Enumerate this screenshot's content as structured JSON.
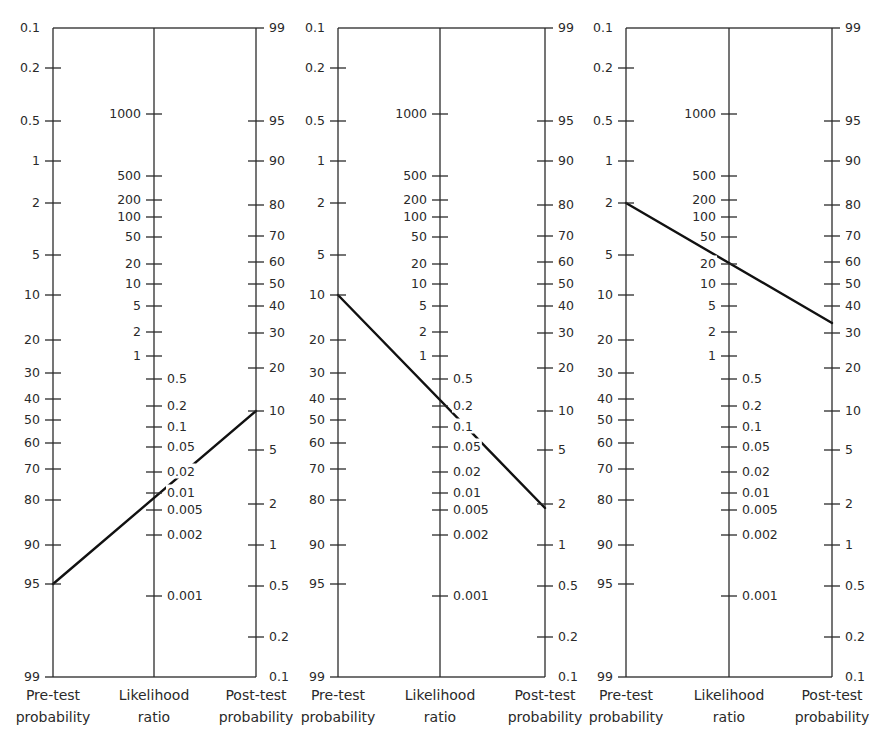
{
  "chart_data": {
    "type": "nomogram",
    "axes": {
      "pre_test": {
        "title_line1": "Pre-test",
        "title_line2": "probability",
        "ticks": [
          {
            "label": "0.1",
            "y": 28
          },
          {
            "label": "0.2",
            "y": 68
          },
          {
            "label": "0.5",
            "y": 121
          },
          {
            "label": "1",
            "y": 161
          },
          {
            "label": "2",
            "y": 203
          },
          {
            "label": "5",
            "y": 255
          },
          {
            "label": "10",
            "y": 295
          },
          {
            "label": "20",
            "y": 340
          },
          {
            "label": "30",
            "y": 373
          },
          {
            "label": "40",
            "y": 399
          },
          {
            "label": "50",
            "y": 420
          },
          {
            "label": "60",
            "y": 443
          },
          {
            "label": "70",
            "y": 469
          },
          {
            "label": "80",
            "y": 500
          },
          {
            "label": "90",
            "y": 545
          },
          {
            "label": "95",
            "y": 584
          },
          {
            "label": "99",
            "y": 677
          }
        ]
      },
      "likelihood_ratio": {
        "title_line1": "Likelihood",
        "title_line2": "ratio",
        "ticks_left": [
          {
            "label": "1000",
            "y": 114
          },
          {
            "label": "500",
            "y": 176
          },
          {
            "label": "200",
            "y": 200
          },
          {
            "label": "100",
            "y": 217
          },
          {
            "label": "50",
            "y": 237
          },
          {
            "label": "20",
            "y": 264
          },
          {
            "label": "10",
            "y": 284
          },
          {
            "label": "5",
            "y": 306
          },
          {
            "label": "2",
            "y": 332
          },
          {
            "label": "1",
            "y": 356
          }
        ],
        "ticks_right": [
          {
            "label": "0.5",
            "y": 379
          },
          {
            "label": "0.2",
            "y": 406
          },
          {
            "label": "0.1",
            "y": 427
          },
          {
            "label": "0.05",
            "y": 447
          },
          {
            "label": "0.02",
            "y": 472
          },
          {
            "label": "0.01",
            "y": 493
          },
          {
            "label": "0.005",
            "y": 510
          },
          {
            "label": "0.002",
            "y": 535
          },
          {
            "label": "0.001",
            "y": 596
          }
        ]
      },
      "post_test": {
        "title_line1": "Post-test",
        "title_line2": "probability",
        "ticks": [
          {
            "label": "99",
            "y": 28
          },
          {
            "label": "95",
            "y": 121
          },
          {
            "label": "90",
            "y": 161
          },
          {
            "label": "80",
            "y": 205
          },
          {
            "label": "70",
            "y": 236
          },
          {
            "label": "60",
            "y": 262
          },
          {
            "label": "50",
            "y": 284
          },
          {
            "label": "40",
            "y": 306
          },
          {
            "label": "30",
            "y": 333
          },
          {
            "label": "20",
            "y": 368
          },
          {
            "label": "10",
            "y": 411
          },
          {
            "label": "5",
            "y": 450
          },
          {
            "label": "2",
            "y": 504
          },
          {
            "label": "1",
            "y": 545
          },
          {
            "label": "0.5",
            "y": 586
          },
          {
            "label": "0.2",
            "y": 637
          },
          {
            "label": "0.1",
            "y": 677
          }
        ]
      }
    },
    "panels": [
      {
        "name": "panel-1",
        "x_pre": 53,
        "x_lr": 154,
        "x_post": 256,
        "pre_test_probability_pct": 95,
        "likelihood_ratio": 0.01,
        "post_test_probability_pct": 10,
        "line": {
          "x1": 53,
          "y1": 584,
          "x2": 256,
          "y2": 411
        }
      },
      {
        "name": "panel-2",
        "x_pre": 338,
        "x_lr": 440,
        "x_post": 545,
        "pre_test_probability_pct": 10,
        "likelihood_ratio": 0.2,
        "post_test_probability_pct": 2,
        "line": {
          "x1": 338,
          "y1": 295,
          "x2": 545,
          "y2": 508
        }
      },
      {
        "name": "panel-3",
        "x_pre": 626,
        "x_lr": 729,
        "x_post": 832,
        "pre_test_probability_pct": 2,
        "likelihood_ratio": 20,
        "post_test_probability_pct": 34,
        "line": {
          "x1": 626,
          "y1": 203,
          "x2": 832,
          "y2": 323
        }
      }
    ],
    "layout": {
      "top_y": 28,
      "bottom_y": 677,
      "grid": false,
      "legend": "none"
    }
  }
}
